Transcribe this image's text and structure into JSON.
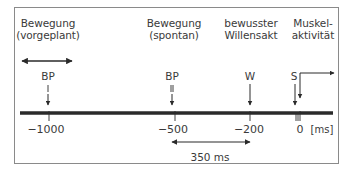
{
  "diagram": {
    "events": [
      {
        "id": "bp1",
        "header": [
          "Bewegung",
          "(vorgeplant)"
        ],
        "marker": "BP",
        "marker_sub": "I",
        "time_ms": -1000
      },
      {
        "id": "bp2",
        "header": [
          "Bewegung",
          "(spontan)"
        ],
        "marker": "BP",
        "marker_sub": "II",
        "time_ms": -500
      },
      {
        "id": "w",
        "header": [
          "bewusster",
          "Willensakt"
        ],
        "marker": "W",
        "time_ms": -200
      },
      {
        "id": "s",
        "header": [
          "Muskel-",
          "aktivität"
        ],
        "marker": "S",
        "time_ms": 0
      }
    ],
    "axis": {
      "ticks": [
        "−1000",
        "−500",
        "−200",
        "0"
      ],
      "unit": "[ms]"
    },
    "interval": {
      "label": "350 ms",
      "from_ms": -550,
      "to_ms": -200
    },
    "colors": {
      "line": "#2a2a2a",
      "text": "#3a3a3a",
      "frame": "#8a8a8a"
    }
  }
}
